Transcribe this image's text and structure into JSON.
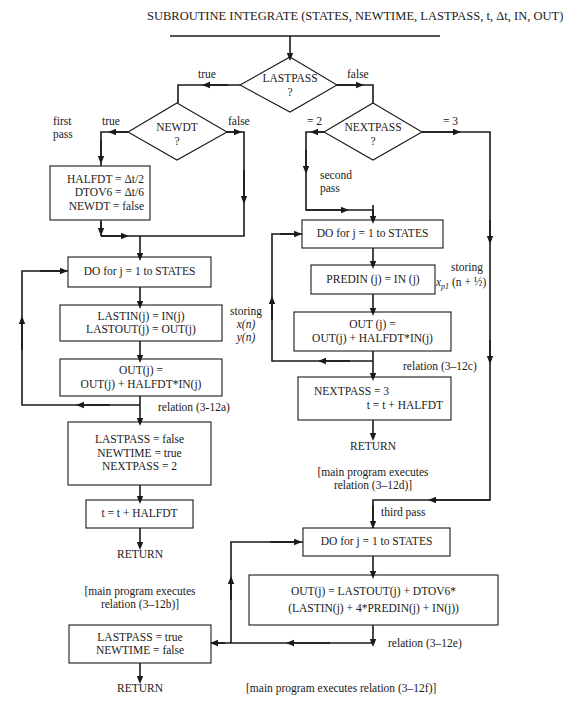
{
  "title": "SUBROUTINE INTEGRATE (STATES, NEWTIME, LASTPASS,  t, Δt,  IN, OUT)",
  "decisions": {
    "lastpass": {
      "label": "LASTPASS",
      "q": "?",
      "true_label": "true",
      "false_label": "false"
    },
    "newdt": {
      "label": "NEWDT",
      "q": "?",
      "true_label": "true",
      "false_label": "false"
    },
    "nextpass": {
      "label": "NEXTPASS",
      "q": "?",
      "eq2_label": "= 2",
      "eq3_label": "= 3"
    }
  },
  "annotations": {
    "first_pass": [
      "first",
      "pass"
    ],
    "second_pass": [
      "second",
      "pass"
    ],
    "third_pass": "third pass",
    "storing_xy": [
      "storing",
      "x(n)",
      "y(n)"
    ],
    "storing_xp1": [
      "storing",
      "x",
      "p1",
      "(n + ½)"
    ],
    "relation_a": "relation (3-12a)",
    "relation_c": "relation (3–12c)",
    "relation_e": "relation (3–12e)",
    "main_b": [
      "[main program executes",
      "relation (3–12b)]"
    ],
    "main_d": [
      "[main program executes",
      "relation (3–12d)]"
    ],
    "main_f": "[main program executes relation (3–12f)]"
  },
  "boxes": {
    "init": [
      "HALFDT = Δt/2",
      "DTOV6 = Δt/6",
      "NEWDT = false"
    ],
    "do_loop_1": "DO for j = 1 to STATES",
    "store_last": [
      "LASTIN(j) = IN(j)",
      "LASTOUT(j) = OUT(j)"
    ],
    "euler_1": [
      "OUT(j) =",
      "OUT(j) + HALFDT*IN(j)"
    ],
    "set_flags_1": [
      "LASTPASS = false",
      "NEWTIME = true",
      "NEXTPASS = 2"
    ],
    "time_step_1": "t = t + HALFDT",
    "do_loop_2": "DO for j = 1 to STATES",
    "store_pred": "PREDIN (j) = IN (j)",
    "euler_2": [
      "OUT (j) =",
      "OUT(j) + HALFDT*IN(j)"
    ],
    "set_flags_2": [
      "NEXTPASS = 3",
      "t = t + HALFDT"
    ],
    "do_loop_3": "DO for j = 1 to STATES",
    "simpson": [
      "OUT(j) = LASTOUT(j) + DTOV6*",
      "(LASTIN(j) + 4*PREDIN(j) + IN(j))"
    ],
    "set_flags_3": [
      "LASTPASS = true",
      "NEWTIME = false"
    ]
  },
  "returns": {
    "r1": "RETURN",
    "r2": "RETURN",
    "r3": "RETURN"
  }
}
